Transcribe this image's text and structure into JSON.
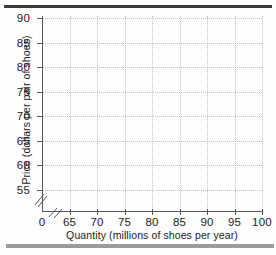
{
  "chart_data": {
    "type": "scatter",
    "title": "",
    "subtitle": "",
    "xlabel": "Quantity (millions of shoes per year)",
    "ylabel": "Price (dollars per pair of shoes)",
    "x_ticks": [
      "0",
      "65",
      "70",
      "75",
      "80",
      "85",
      "90",
      "95",
      "100"
    ],
    "x_tick_values": [
      0,
      65,
      70,
      75,
      80,
      85,
      90,
      95,
      100
    ],
    "y_ticks": [
      "55",
      "60",
      "65",
      "70",
      "75",
      "80",
      "85",
      "90"
    ],
    "y_tick_values": [
      55,
      60,
      65,
      70,
      75,
      80,
      85,
      90
    ],
    "xlim": [
      65,
      100
    ],
    "ylim": [
      55,
      90
    ],
    "grid": true,
    "grid_style": "dotted",
    "legend": "none",
    "series": [],
    "values": [],
    "categories": [],
    "annotations": [
      "axis-break on x-axis between 0 and 65",
      "axis-break on y-axis below 55"
    ],
    "note": "Empty grid / blank plotting template with no plotted data points"
  },
  "figure": {
    "rule_top_color": "#3a3a3f",
    "rule_bottom_color": "#9b9b9e",
    "axis_color": "#58585c",
    "grid_color": "#c2c2c6",
    "background_color": "#fefefe",
    "text_color": "#1b1b1b"
  }
}
